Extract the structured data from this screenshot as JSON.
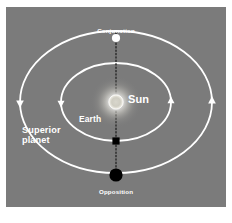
{
  "figure": {
    "panel_background": "#7b7b7b",
    "caption": ""
  },
  "labels": {
    "conjunction": "Conjunction",
    "opposition": "Opposition",
    "sun": "Sun",
    "earth": "Earth",
    "superior_planet_line1": "Superior",
    "superior_planet_line2": "planet"
  },
  "colors": {
    "panel": "#7b7b7b",
    "orbit": "#ffffff",
    "text": "#ffffff",
    "sun_core": "#ffffff",
    "sun_glow": "#ffffff",
    "body_dark": "#000000",
    "body_light": "#ffffff",
    "sight_line": "#1a1a1a"
  },
  "diagram_data": {
    "type": "orbital-diagram",
    "center": {
      "x": 110,
      "y": 95
    },
    "orbits": [
      {
        "name": "earth-orbit",
        "role": "inner",
        "rx": 55,
        "ry": 39,
        "stroke": "#ffffff",
        "direction": "counterclockwise",
        "arrow_markers": [
          {
            "name": "earth-orbit-arrow-left",
            "x": 55,
            "y": 95,
            "points": "down"
          },
          {
            "name": "earth-orbit-arrow-right",
            "x": 165,
            "y": 95,
            "points": "up"
          }
        ]
      },
      {
        "name": "superior-planet-orbit",
        "role": "outer",
        "rx": 96,
        "ry": 71,
        "stroke": "#ffffff",
        "direction": "counterclockwise",
        "arrow_markers": [
          {
            "name": "superior-orbit-arrow-left",
            "x": 14,
            "y": 95,
            "points": "down"
          },
          {
            "name": "superior-orbit-arrow-right",
            "x": 206,
            "y": 95,
            "points": "up"
          }
        ]
      }
    ],
    "bodies": [
      {
        "name": "sun",
        "label": "Sun",
        "x": 110,
        "y": 95,
        "radius": 7,
        "style": "glowing-disc",
        "fill": "#ffffff"
      },
      {
        "name": "earth",
        "label": "Earth",
        "x": 110,
        "y": 134,
        "size": 7,
        "style": "filled-square",
        "fill": "#000000",
        "on_orbit": "earth-orbit"
      },
      {
        "name": "planet-at-conjunction",
        "label": "Conjunction",
        "x": 110,
        "y": 31,
        "radius": 4,
        "style": "filled-circle",
        "fill": "#ffffff",
        "on_orbit": "superior-planet-orbit"
      },
      {
        "name": "planet-at-opposition",
        "label": "Opposition",
        "x": 110,
        "y": 168,
        "radius": 6.5,
        "style": "filled-circle",
        "fill": "#000000",
        "on_orbit": "superior-planet-orbit"
      }
    ],
    "sight_line": {
      "name": "alignment-line",
      "orientation": "vertical",
      "x": 110,
      "y_start": 26,
      "y_end": 172,
      "style": "dotted",
      "stroke": "#1a1a1a",
      "passes_through": [
        "planet-at-conjunction",
        "sun",
        "earth",
        "planet-at-opposition"
      ]
    }
  }
}
